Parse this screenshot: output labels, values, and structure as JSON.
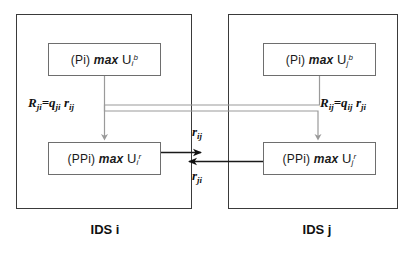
{
  "diagram": {
    "containers": [
      {
        "id": "ids-i",
        "caption": "IDS i"
      },
      {
        "id": "ids-j",
        "caption": "IDS j"
      }
    ],
    "boxes": {
      "pi_i": {
        "prefix": "(Pi)",
        "operator": "max",
        "symbol": "U",
        "subscript": "i",
        "superscript": "b"
      },
      "pi_j": {
        "prefix": "(Pi)",
        "operator": "max",
        "symbol": "U",
        "subscript": "j",
        "superscript": "b"
      },
      "ppi_i": {
        "prefix": "(PPi)",
        "operator": "max",
        "symbol": "U",
        "subscript": "i",
        "superscript": "r"
      },
      "ppi_j": {
        "prefix": "(PPi)",
        "operator": "max",
        "symbol": "U",
        "subscript": "j",
        "superscript": "r"
      }
    },
    "equations": {
      "left": {
        "lhs": "R",
        "lhs_sub": "ji",
        "q": "q",
        "q_sub": "ji",
        "r": "r",
        "r_sub": "ij"
      },
      "right": {
        "lhs": "R",
        "lhs_sub": "ij",
        "q": "q",
        "q_sub": "ij",
        "r": "r",
        "r_sub": "ji"
      }
    },
    "arrow_labels": {
      "top": {
        "symbol": "r",
        "subscript": "ij"
      },
      "bottom": {
        "symbol": "r",
        "subscript": "ji"
      }
    },
    "colors": {
      "container_border": "#3a3a3a",
      "box_border": "#6e6e6e",
      "cross_connector": "#9a9a9a",
      "exchange_arrow": "#1a1a1a",
      "text": "#111111",
      "background": "#ffffff"
    }
  }
}
